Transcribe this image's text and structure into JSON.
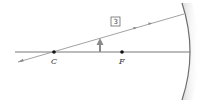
{
  "diagram": {
    "type": "concave-mirror-ray-diagram",
    "points": {
      "center_label": "C",
      "focal_label": "F"
    },
    "ray_label": "3",
    "colors": {
      "axis": "#7a7a7a",
      "ray": "#8a8a8a",
      "mirror": "#6e6e6e",
      "object": "#8a8a8a",
      "points": "#111111"
    }
  }
}
